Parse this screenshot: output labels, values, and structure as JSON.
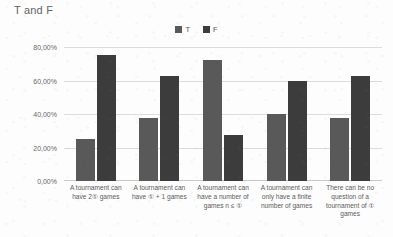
{
  "chart_data": {
    "type": "bar",
    "title": "T and F",
    "xlabel": "",
    "ylabel": "",
    "ylim": [
      0,
      80
    ],
    "grid": true,
    "legend_position": "top-center",
    "value_suffix": "%",
    "decimal_separator": ",",
    "y_ticks": [
      "0,00%",
      "20,00%",
      "40,00%",
      "60,00%",
      "80,00%"
    ],
    "y_tick_values": [
      0,
      20,
      40,
      60,
      80
    ],
    "categories": [
      "A tournament can have 2① games",
      "A tournament can have ① + 1 games",
      "A tournament can have a number of games n ≤ ①",
      "A tournament can only have a finite number of games",
      "There can be no question of a tournament of ① games"
    ],
    "series": [
      {
        "name": "T",
        "color": "#595959",
        "values": [
          25,
          37.5,
          72,
          40,
          37.5
        ]
      },
      {
        "name": "F",
        "color": "#3c3c3c",
        "values": [
          75,
          62.5,
          27.5,
          60,
          62.5
        ]
      }
    ]
  },
  "colors": {
    "series_t": "#595959",
    "series_f": "#3c3c3c",
    "gridline": "#dcdcdc",
    "axis_text": "#666666",
    "title_text": "#636363",
    "background": "#fdfdfd"
  }
}
